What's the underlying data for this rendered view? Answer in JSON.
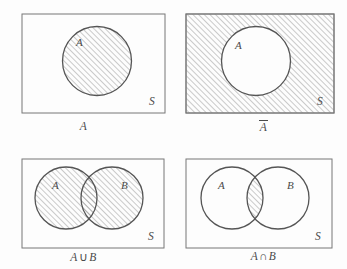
{
  "figure": {
    "background_color": "#fdfdfd",
    "stroke_color": "#555555",
    "hatch_color": "#8c8c8c",
    "label_color": "#4a4a4a",
    "hatch_angle_deg": 45,
    "hatch_spacing_px": 4
  },
  "panels": [
    {
      "id": "A",
      "caption": "A",
      "caption_parts": {
        "main": "A",
        "overbar": false
      },
      "universe_label": "S",
      "set_labels": [
        "A"
      ],
      "shaded_region": "A",
      "shape": "one-circle",
      "rect": {
        "x": 0,
        "y": 0,
        "width": 143,
        "height": 99
      },
      "circles": [
        {
          "label": "A",
          "cx": 75,
          "cy": 47,
          "r": 34.5
        }
      ]
    },
    {
      "id": "not-A",
      "caption": "A̅",
      "caption_parts": {
        "main": "A",
        "overbar": true
      },
      "universe_label": "S",
      "set_labels": [
        "A"
      ],
      "shaded_region": "complement of A",
      "shape": "one-circle",
      "rect": {
        "x": 0,
        "y": 0,
        "width": 148,
        "height": 99
      },
      "circles": [
        {
          "label": "A",
          "cx": 70,
          "cy": 47,
          "r": 34.5
        }
      ]
    },
    {
      "id": "A-union-B",
      "caption": "A ∪ B",
      "caption_parts": {
        "left": "A",
        "op": "∪",
        "right": "B"
      },
      "universe_label": "S",
      "set_labels": [
        "A",
        "B"
      ],
      "shaded_region": "A union B",
      "shape": "two-circles",
      "rect": {
        "x": 0,
        "y": 0,
        "width": 142,
        "height": 89
      },
      "circles": [
        {
          "label": "A",
          "cx": 44,
          "cy": 39,
          "r": 31
        },
        {
          "label": "B",
          "cx": 90,
          "cy": 39,
          "r": 31
        }
      ]
    },
    {
      "id": "A-intersect-B",
      "caption": "A ∩ B",
      "caption_parts": {
        "left": "A",
        "op": "∩",
        "right": "B"
      },
      "universe_label": "S",
      "set_labels": [
        "A",
        "B"
      ],
      "shaded_region": "A intersect B",
      "shape": "two-circles",
      "rect": {
        "x": 0,
        "y": 0,
        "width": 146,
        "height": 89
      },
      "circles": [
        {
          "label": "A",
          "cx": 46,
          "cy": 39,
          "r": 31
        },
        {
          "label": "B",
          "cx": 92,
          "cy": 39,
          "r": 31
        }
      ]
    }
  ]
}
